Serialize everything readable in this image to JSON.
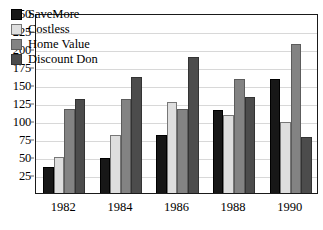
{
  "chart_data": {
    "type": "bar",
    "title": "",
    "xlabel": "",
    "ylabel": "",
    "categories": [
      "1982",
      "1984",
      "1986",
      "1988",
      "1990"
    ],
    "series": [
      {
        "name": "SaveMore",
        "color": "#171717",
        "values": [
          36,
          49,
          80,
          115,
          159
        ]
      },
      {
        "name": "Costless",
        "color": "#dedede",
        "values": [
          50,
          80,
          126,
          109,
          99
        ]
      },
      {
        "name": "Home Value",
        "color": "#838383",
        "values": [
          117,
          131,
          116,
          159,
          207
        ]
      },
      {
        "name": "Discount Don",
        "color": "#4c4c4c",
        "values": [
          131,
          161,
          189,
          134,
          78
        ]
      }
    ],
    "ylim": [
      0,
      250
    ],
    "yticks": [
      25,
      50,
      75,
      100,
      125,
      150,
      175,
      200,
      225,
      250
    ],
    "ytick_labels": [
      "25",
      "50",
      "75",
      "100",
      "125",
      "150",
      "175",
      "200",
      "225",
      "250"
    ],
    "grid": true,
    "legend_position": "top-left",
    "legend_entries": [
      "SaveMore",
      "Costless",
      "Home Value",
      "Discount Don"
    ]
  }
}
